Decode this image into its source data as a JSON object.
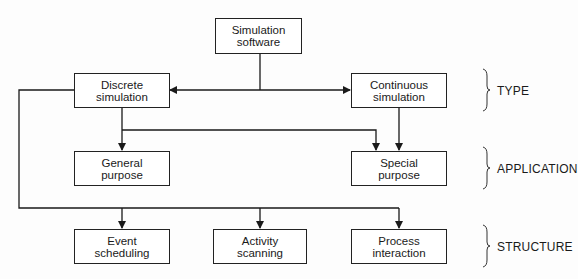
{
  "diagram": {
    "nodes": {
      "root": {
        "line1": "Simulation",
        "line2": "software"
      },
      "discrete": {
        "line1": "Discrete",
        "line2": "simulation"
      },
      "continuous": {
        "line1": "Continuous",
        "line2": "simulation"
      },
      "general": {
        "line1": "General",
        "line2": "purpose"
      },
      "special": {
        "line1": "Special",
        "line2": "purpose"
      },
      "event": {
        "line1": "Event",
        "line2": "scheduling"
      },
      "activity": {
        "line1": "Activity",
        "line2": "scanning"
      },
      "process": {
        "line1": "Process",
        "line2": "interaction"
      }
    },
    "levels": {
      "type": "TYPE",
      "application": "APPLICATION",
      "structure": "STRUCTURE"
    },
    "edges": [
      [
        "Simulation software",
        "Discrete simulation"
      ],
      [
        "Simulation software",
        "Continuous simulation"
      ],
      [
        "Discrete simulation",
        "General purpose"
      ],
      [
        "Discrete simulation",
        "Special purpose"
      ],
      [
        "Continuous simulation",
        "Special purpose"
      ],
      [
        "Discrete simulation",
        "Event scheduling"
      ],
      [
        "Discrete simulation",
        "Activity scanning"
      ],
      [
        "Discrete simulation",
        "Process interaction"
      ]
    ],
    "colors": {
      "line": "#1a1a1a",
      "background": "#fdfdfd"
    }
  }
}
